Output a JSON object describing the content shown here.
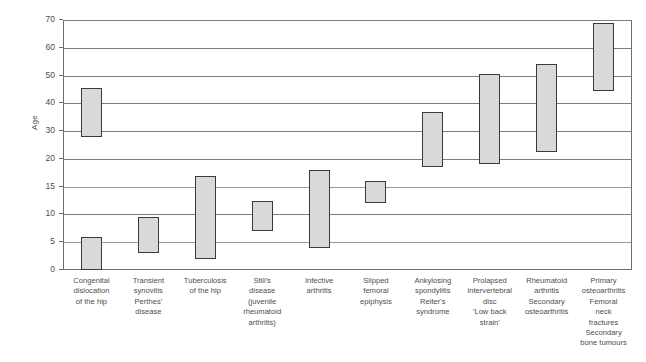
{
  "chart_data": {
    "type": "bar",
    "title": "",
    "xlabel": "",
    "ylabel": "Age",
    "orientation": "vertical",
    "bar_style": "floating range bars (age range per condition)",
    "grid": true,
    "legend": null,
    "y_axis": {
      "label": "Age",
      "ticks": [
        0,
        5,
        10,
        15,
        20,
        30,
        40,
        50,
        60,
        70
      ],
      "scale": "non-linear / broken: equal spacing between consecutive listed ticks",
      "min": 0,
      "max": 70
    },
    "categories": [
      "Congenital dislocation of the hip",
      "Transient synovitis Perthes' disease",
      "Tuberculosis of the hip",
      "Still's disease (juvenile rheumatoid arthritis)",
      "Infective arthritis",
      "Slipped femoral epiphysis",
      "Ankylosing spondylitis Reiter's syndrome",
      "Prolapsed intervertebral disc 'Low back strain'",
      "Rheumatoid arthritis Secondary osteoarthritis",
      "Primary osteoarthritis Femoral neck fractures Secondary bone tumours"
    ],
    "category_label_lines": [
      [
        "Congenital",
        "dislocation",
        "of the hip"
      ],
      [
        "Transient",
        "synovitis",
        "Perthes'",
        "disease"
      ],
      [
        "Tuberculosis",
        "of the hip"
      ],
      [
        "Still's",
        "disease",
        "(juvenile",
        "rheumatoid",
        "arthritis)"
      ],
      [
        "Infective",
        "arthritis"
      ],
      [
        "Slipped",
        "femoral",
        "epiphysis"
      ],
      [
        "Ankylosing",
        "spondylitis",
        "Reiter's",
        "syndrome"
      ],
      [
        "Prolapsed",
        "intervertebral",
        "disc",
        "'Low back",
        "strain'"
      ],
      [
        "Rheumatoid",
        "arthritis",
        "Secondary",
        "osteoarthritis"
      ],
      [
        "Primary",
        "osteoarthritis",
        "Femoral",
        "neck",
        "fractures",
        "Secondary",
        "bone tumours"
      ]
    ],
    "ranges": [
      {
        "category": "Congenital dislocation of the hip",
        "segments": [
          {
            "low": 0,
            "high": 6
          },
          {
            "low": 28,
            "high": 45.5
          }
        ]
      },
      {
        "category": "Transient synovitis Perthes' disease",
        "segments": [
          {
            "low": 3,
            "high": 9.5
          }
        ]
      },
      {
        "category": "Tuberculosis of the hip",
        "segments": [
          {
            "low": 2,
            "high": 17
          }
        ]
      },
      {
        "category": "Still's disease (juvenile rheumatoid arthritis)",
        "segments": [
          {
            "low": 7,
            "high": 12.5
          }
        ]
      },
      {
        "category": "Infective arthritis",
        "segments": [
          {
            "low": 4,
            "high": 18
          }
        ]
      },
      {
        "category": "Slipped femoral epiphysis",
        "segments": [
          {
            "low": 12,
            "high": 16
          }
        ]
      },
      {
        "category": "Ankylosing spondylitis Reiter's syndrome",
        "segments": [
          {
            "low": 18.5,
            "high": 37
          }
        ]
      },
      {
        "category": "Prolapsed intervertebral disc 'Low back strain'",
        "segments": [
          {
            "low": 19,
            "high": 50.5
          }
        ]
      },
      {
        "category": "Rheumatoid arthritis Secondary osteoarthritis",
        "segments": [
          {
            "low": 22.5,
            "high": 54
          }
        ]
      },
      {
        "category": "Primary osteoarthritis Femoral neck fractures Secondary bone tumours",
        "segments": [
          {
            "low": 44.5,
            "high": 69
          }
        ]
      }
    ],
    "colors": {
      "bar_fill": "#d9d9d9",
      "bar_border": "#3a3a3a",
      "gridline": "#7d7d7d",
      "axis": "#6e6e6e",
      "text": "#4d4d4d",
      "background": "#ffffff"
    }
  }
}
